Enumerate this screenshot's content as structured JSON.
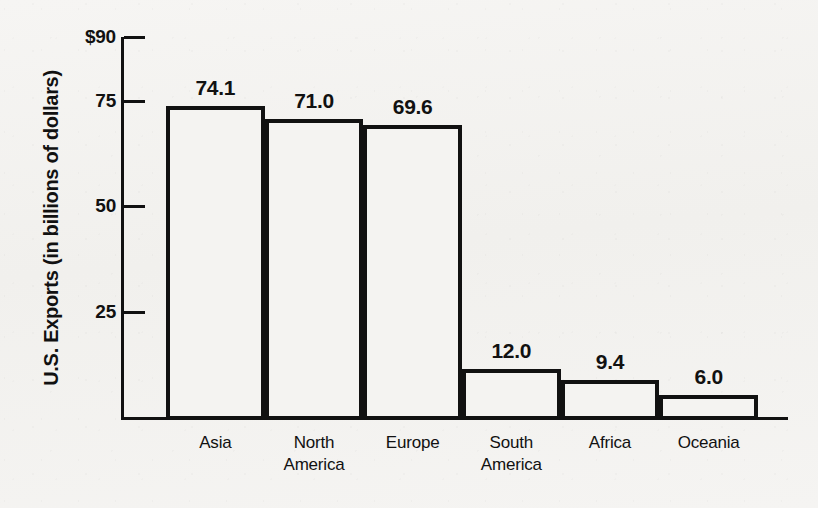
{
  "chart_data": {
    "type": "bar",
    "title": "",
    "subtitle": "",
    "xlabel": "",
    "ylabel": "U.S. Exports (in billions of dollars)",
    "categories": [
      "Asia",
      "North America",
      "Europe",
      "South America",
      "Africa",
      "Oceania"
    ],
    "values": [
      74.1,
      71.0,
      69.6,
      12.0,
      9.4,
      6.0
    ],
    "value_labels": [
      "74.1",
      "71.0",
      "69.6",
      "12.0",
      "9.4",
      "6.0"
    ],
    "ylim": [
      0,
      90
    ],
    "y_ticks": [
      90,
      75,
      50,
      25
    ],
    "y_tick_labels": [
      "$90",
      "75",
      "50",
      "25"
    ],
    "grid": false,
    "legend": null,
    "legend_position": "none",
    "annotations": [],
    "series": [
      {
        "name": "U.S. Exports",
        "values": [
          74.1,
          71.0,
          69.6,
          12.0,
          9.4,
          6.0
        ]
      }
    ]
  },
  "style": {
    "background_color": "#f4f3f1",
    "ink_color": "#111111",
    "bar_fill_color": "#f4f3f1",
    "bar_border_color": "#111111"
  },
  "axis": {
    "y_title": "U.S. Exports (in billions of dollars)",
    "ticks": [
      {
        "label": "$90",
        "value": 90
      },
      {
        "label": "75",
        "value": 75
      },
      {
        "label": "50",
        "value": 50
      },
      {
        "label": "25",
        "value": 25
      }
    ]
  },
  "bars": [
    {
      "category": "Asia",
      "category_line1": "Asia",
      "category_line2": "",
      "value": 74.1,
      "value_label": "74.1"
    },
    {
      "category": "North America",
      "category_line1": "North",
      "category_line2": "America",
      "value": 71.0,
      "value_label": "71.0"
    },
    {
      "category": "Europe",
      "category_line1": "Europe",
      "category_line2": "",
      "value": 69.6,
      "value_label": "69.6"
    },
    {
      "category": "South America",
      "category_line1": "South",
      "category_line2": "America",
      "value": 12.0,
      "value_label": "12.0"
    },
    {
      "category": "Africa",
      "category_line1": "Africa",
      "category_line2": "",
      "value": 9.4,
      "value_label": "9.4"
    },
    {
      "category": "Oceania",
      "category_line1": "Oceania",
      "category_line2": "",
      "value": 6.0,
      "value_label": "6.0"
    }
  ]
}
